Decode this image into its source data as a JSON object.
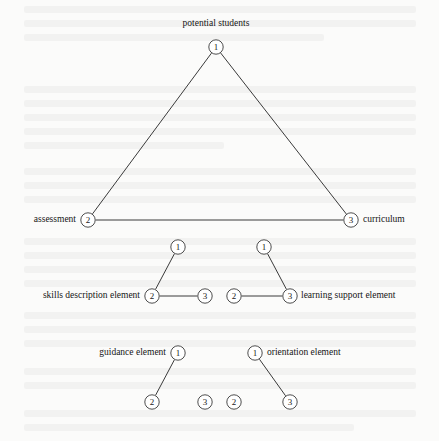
{
  "figure": {
    "type": "node-link-diagram",
    "background_color": "#fbfbfa",
    "line_color": "#3a3a3a",
    "text_color": "#151515",
    "node_radius": 7.2,
    "width": 439,
    "height": 441
  },
  "labels": {
    "potential_students": "potential students",
    "assessment": "assessment",
    "curriculum": "curriculum",
    "skills_description_element": "skills description element",
    "learning_support_element": "learning support element",
    "guidance_element": "guidance element",
    "orientation_element": "orientation element"
  },
  "numbers": {
    "one": "1",
    "two": "2",
    "three": "3"
  },
  "nodes": [
    {
      "id": "top-1",
      "num": "1",
      "x": 216,
      "y": 47,
      "group": "main-triangle"
    },
    {
      "id": "assessment-2",
      "num": "2",
      "x": 88,
      "y": 220,
      "group": "main-triangle"
    },
    {
      "id": "curriculum-3",
      "num": "3",
      "x": 351,
      "y": 220,
      "group": "main-triangle"
    },
    {
      "id": "skills-1",
      "num": "1",
      "x": 178,
      "y": 247,
      "group": "skills-triangle"
    },
    {
      "id": "skills-2",
      "num": "2",
      "x": 152,
      "y": 296,
      "group": "skills-triangle"
    },
    {
      "id": "skills-3",
      "num": "3",
      "x": 205,
      "y": 296,
      "group": "skills-triangle"
    },
    {
      "id": "learning-1",
      "num": "1",
      "x": 264,
      "y": 247,
      "group": "learning-triangle"
    },
    {
      "id": "learning-2",
      "num": "2",
      "x": 234,
      "y": 296,
      "group": "learning-triangle"
    },
    {
      "id": "learning-3",
      "num": "3",
      "x": 290,
      "y": 296,
      "group": "learning-triangle"
    },
    {
      "id": "guidance-1",
      "num": "1",
      "x": 178,
      "y": 353,
      "group": "guidance-triangle"
    },
    {
      "id": "guidance-2",
      "num": "2",
      "x": 152,
      "y": 402,
      "group": "guidance-triangle"
    },
    {
      "id": "guidance-3",
      "num": "3",
      "x": 205,
      "y": 402,
      "group": "guidance-triangle"
    },
    {
      "id": "orientation-1",
      "num": "1",
      "x": 255,
      "y": 353,
      "group": "orientation-triangle"
    },
    {
      "id": "orientation-2",
      "num": "2",
      "x": 234,
      "y": 402,
      "group": "orientation-triangle"
    },
    {
      "id": "orientation-3",
      "num": "3",
      "x": 290,
      "y": 402,
      "group": "orientation-triangle"
    }
  ],
  "edges": [
    {
      "from": "top-1",
      "to": "assessment-2"
    },
    {
      "from": "top-1",
      "to": "curriculum-3"
    },
    {
      "from": "assessment-2",
      "to": "curriculum-3"
    },
    {
      "from": "skills-1",
      "to": "skills-2"
    },
    {
      "from": "skills-2",
      "to": "skills-3"
    },
    {
      "from": "learning-1",
      "to": "learning-3"
    },
    {
      "from": "learning-2",
      "to": "learning-3"
    },
    {
      "from": "guidance-1",
      "to": "guidance-2"
    },
    {
      "from": "orientation-1",
      "to": "orientation-3"
    }
  ],
  "text_labels": [
    {
      "id": "potential-students-label",
      "key": "potential_students",
      "x": 216,
      "y": 24,
      "anchor": "center"
    },
    {
      "id": "assessment-label",
      "key": "assessment",
      "x": 76,
      "y": 220,
      "anchor": "right"
    },
    {
      "id": "curriculum-label",
      "key": "curriculum",
      "x": 363,
      "y": 220,
      "anchor": "left"
    },
    {
      "id": "skills-label",
      "key": "skills_description_element",
      "x": 140,
      "y": 296,
      "anchor": "right"
    },
    {
      "id": "learning-label",
      "key": "learning_support_element",
      "x": 301,
      "y": 296,
      "anchor": "left"
    },
    {
      "id": "guidance-label",
      "key": "guidance_element",
      "x": 166,
      "y": 353,
      "anchor": "right"
    },
    {
      "id": "orientation-label",
      "key": "orientation_element",
      "x": 267,
      "y": 353,
      "anchor": "left"
    }
  ],
  "bleed_lines": [
    {
      "x": 24,
      "y": 6,
      "w": 392
    },
    {
      "x": 24,
      "y": 20,
      "w": 392
    },
    {
      "x": 24,
      "y": 34,
      "w": 300
    },
    {
      "x": 24,
      "y": 86,
      "w": 392
    },
    {
      "x": 24,
      "y": 100,
      "w": 392
    },
    {
      "x": 24,
      "y": 114,
      "w": 392
    },
    {
      "x": 24,
      "y": 128,
      "w": 392
    },
    {
      "x": 24,
      "y": 142,
      "w": 200
    },
    {
      "x": 24,
      "y": 168,
      "w": 392
    },
    {
      "x": 24,
      "y": 182,
      "w": 392
    },
    {
      "x": 24,
      "y": 196,
      "w": 392
    },
    {
      "x": 24,
      "y": 238,
      "w": 392
    },
    {
      "x": 24,
      "y": 252,
      "w": 392
    },
    {
      "x": 24,
      "y": 266,
      "w": 392
    },
    {
      "x": 24,
      "y": 280,
      "w": 392
    },
    {
      "x": 24,
      "y": 312,
      "w": 392
    },
    {
      "x": 24,
      "y": 326,
      "w": 392
    },
    {
      "x": 24,
      "y": 340,
      "w": 392
    },
    {
      "x": 24,
      "y": 368,
      "w": 392
    },
    {
      "x": 24,
      "y": 382,
      "w": 392
    },
    {
      "x": 24,
      "y": 410,
      "w": 392
    },
    {
      "x": 24,
      "y": 424,
      "w": 330
    }
  ]
}
